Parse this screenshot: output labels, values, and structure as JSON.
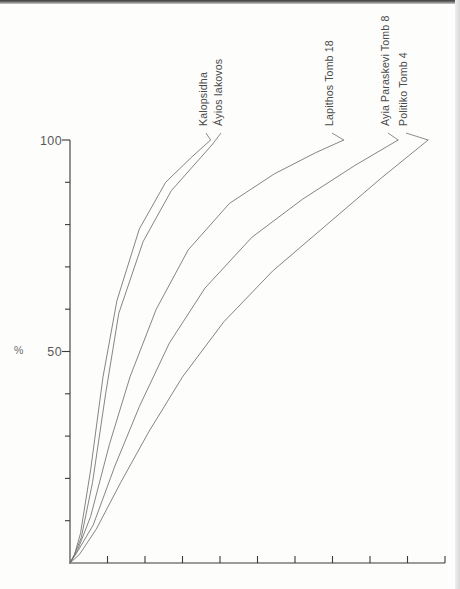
{
  "figure": {
    "background_color": "#fdfdfc",
    "ink_color": "#6f6f70",
    "axis_color": "#3a3a3a"
  },
  "chart_data": {
    "type": "line",
    "title": "",
    "subtitle": "",
    "xlabel": "",
    "ylabel": "%",
    "ylim": [
      0,
      105
    ],
    "xlim": [
      0,
      10
    ],
    "grid": false,
    "legend_position": "inline-labels-top",
    "y_ticks": [
      0,
      10,
      20,
      30,
      40,
      50,
      60,
      70,
      80,
      90,
      100
    ],
    "y_tick_labels": [
      "",
      "",
      "",
      "",
      "",
      "50",
      "",
      "",
      "",
      "",
      "100"
    ],
    "x_ticks": [
      0,
      1,
      2,
      3,
      4,
      5,
      6,
      7,
      8,
      9,
      10
    ],
    "x_tick_labels": [
      "",
      "",
      "",
      "",
      "",
      "",
      "",
      "",
      "",
      "",
      ""
    ],
    "series": [
      {
        "name": "Kalopsidha",
        "label": "Kalopsidha",
        "color": "#6f6f70",
        "x": [
          0.0,
          0.12,
          0.28,
          0.55,
          0.88,
          1.25,
          1.85,
          2.55,
          3.25,
          3.75
        ],
        "values": [
          0,
          2,
          7,
          22,
          44,
          62,
          79,
          90,
          96,
          100
        ]
      },
      {
        "name": "Ayios Iakovos",
        "label": "Áyios Iakovos",
        "color": "#6f6f70",
        "x": [
          0.0,
          0.12,
          0.3,
          0.6,
          0.95,
          1.3,
          1.95,
          2.7,
          3.4,
          3.8
        ],
        "values": [
          0,
          2,
          6,
          19,
          40,
          59,
          76,
          88,
          95,
          99
        ]
      },
      {
        "name": "Lapithos Tomb 18",
        "label": "Lapithos Tomb 18",
        "color": "#6f6f70",
        "x": [
          0.0,
          0.2,
          0.55,
          1.05,
          1.6,
          2.3,
          3.15,
          4.25,
          5.45,
          6.55,
          7.3
        ],
        "values": [
          0,
          3,
          11,
          28,
          44,
          60,
          74,
          85,
          92,
          97,
          100
        ]
      },
      {
        "name": "Ayia Paraskevi Tomb 8",
        "label": "Ayia Paraskevi Tomb 8",
        "color": "#6f6f70",
        "x": [
          0.0,
          0.22,
          0.62,
          1.2,
          1.85,
          2.65,
          3.6,
          4.85,
          6.2,
          7.6,
          8.75
        ],
        "values": [
          0,
          3,
          9,
          23,
          37,
          52,
          65,
          77,
          86,
          94,
          100
        ]
      },
      {
        "name": "Politiko Tomb 4",
        "label": "Politiko Tomb 4",
        "color": "#6f6f70",
        "x": [
          0.0,
          0.25,
          0.7,
          1.35,
          2.1,
          3.0,
          4.1,
          5.4,
          6.85,
          8.3,
          9.55
        ],
        "values": [
          0,
          2,
          8,
          19,
          31,
          44,
          57,
          69,
          80,
          91,
          100
        ]
      }
    ],
    "annotations": [
      {
        "text": "Kalopsidha",
        "rotation": -90
      },
      {
        "text": "Áyios Iakovos",
        "rotation": -90
      },
      {
        "text": "Lapithos Tomb 18",
        "rotation": -90
      },
      {
        "text": "Ayia Paraskevi Tomb 8",
        "rotation": -90
      },
      {
        "text": "Politiko Tomb 4",
        "rotation": -90
      }
    ]
  },
  "axes": {
    "y_label": "%",
    "y_tick_100": "100",
    "y_tick_50": "50"
  },
  "labels": {
    "s0": "Kalopsidha",
    "s1": "Áyios Iakovos",
    "s2": "Lapithos Tomb 18",
    "s3": "Ayia Paraskevi Tomb 8",
    "s4": "Politiko Tomb 4"
  }
}
